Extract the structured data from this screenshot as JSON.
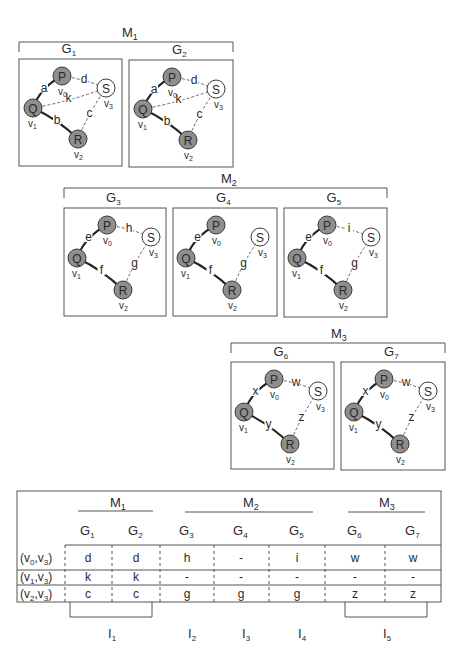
{
  "groups": [
    {
      "id": "M1",
      "label": "M",
      "sub": "1",
      "x1": 19,
      "x2": 233,
      "bracket_y": 42,
      "label_x": 126,
      "label_y": 36
    },
    {
      "id": "M2",
      "label": "M",
      "sub": "2",
      "x1": 64,
      "x2": 387,
      "bracket_y": 188,
      "label_x": 228,
      "label_y": 182
    },
    {
      "id": "M3",
      "label": "M",
      "sub": "3",
      "x1": 231,
      "x2": 445,
      "bracket_y": 343,
      "label_x": 338,
      "label_y": 337
    }
  ],
  "graphs": [
    {
      "id": "G1",
      "label": "G",
      "sub": "1",
      "x": 19,
      "y": 59,
      "w": 103,
      "h": 107,
      "edges": {
        "a": "a",
        "b": "b",
        "k": "k",
        "c": "c",
        "d": "d",
        "e": "",
        "f": "",
        "g": "",
        "h": ""
      },
      "variant": "full"
    },
    {
      "id": "G2",
      "label": "G",
      "sub": "2",
      "x": 129,
      "y": 60,
      "w": 104,
      "h": 107,
      "variant": "full"
    },
    {
      "id": "G3",
      "label": "G",
      "sub": "3",
      "x": 64,
      "y": 208,
      "w": 102,
      "h": 108,
      "variant": "m2"
    },
    {
      "id": "G4",
      "label": "G",
      "sub": "4",
      "x": 173,
      "y": 208,
      "w": 104,
      "h": 108,
      "variant": "m2"
    },
    {
      "id": "G5",
      "label": "G",
      "sub": "5",
      "x": 284,
      "y": 208,
      "w": 103,
      "h": 109,
      "variant": "m2"
    },
    {
      "id": "G6",
      "label": "G",
      "sub": "6",
      "x": 231,
      "y": 362,
      "w": 103,
      "h": 107,
      "variant": "m3"
    },
    {
      "id": "G7",
      "label": "G",
      "sub": "7",
      "x": 341,
      "y": 362,
      "w": 104,
      "h": 108,
      "variant": "m3"
    }
  ],
  "graph_edges": {
    "G1": {
      "PQ": "a",
      "QR": "b",
      "QS": "k",
      "RS": "c",
      "PS": "d"
    },
    "G2": {
      "PQ": "a",
      "QR": "b",
      "QS": "k",
      "RS": "c",
      "PS": "d"
    },
    "G3": {
      "PQ": "e",
      "QR": "f",
      "QS": "",
      "RS": "g",
      "PS": "h"
    },
    "G4": {
      "PQ": "e",
      "QR": "f",
      "QS": "",
      "RS": "g",
      "PS": ""
    },
    "G5": {
      "PQ": "e",
      "QR": "f",
      "QS": "",
      "RS": "g",
      "PS": "i"
    },
    "G6": {
      "PQ": "x",
      "QR": "y",
      "QS": "",
      "RS": "z",
      "PS": "w"
    },
    "G7": {
      "PQ": "x",
      "QR": "y",
      "QS": "",
      "RS": "z",
      "PS": "w"
    }
  },
  "nodes": [
    {
      "id": "P",
      "label": "P",
      "vertex": "v",
      "vsub": "0",
      "filled": true
    },
    {
      "id": "Q",
      "label": "Q",
      "vertex": "v",
      "vsub": "1",
      "filled": true
    },
    {
      "id": "R",
      "label": "R",
      "vertex": "v",
      "vsub": "2",
      "filled": true
    },
    {
      "id": "S",
      "label": "S",
      "vertex": "v",
      "vsub": "3",
      "filled": false
    }
  ],
  "colors": {
    "node_fill": "#8e8e8e",
    "node_stroke": "#3a3a3a",
    "open_fill": "#ffffff",
    "line": "#2a2a2a",
    "frame": "#555555"
  },
  "table": {
    "group_headers": [
      {
        "label": "M",
        "sub": "1"
      },
      {
        "label": "M",
        "sub": "2"
      },
      {
        "label": "M",
        "sub": "3"
      }
    ],
    "columns": [
      {
        "label": "G",
        "sub": "1"
      },
      {
        "label": "G",
        "sub": "2"
      },
      {
        "label": "G",
        "sub": "3"
      },
      {
        "label": "G",
        "sub": "4"
      },
      {
        "label": "G",
        "sub": "5"
      },
      {
        "label": "G",
        "sub": "6"
      },
      {
        "label": "G",
        "sub": "7"
      }
    ],
    "rows": [
      {
        "header": "(v0,v3)",
        "h1": "0",
        "h2": "3",
        "cells": [
          "d",
          "d",
          "h",
          "-",
          "i",
          "w",
          "w"
        ]
      },
      {
        "header": "(v1,v3)",
        "h1": "1",
        "h2": "3",
        "cells": [
          "k",
          "k",
          "-",
          "-",
          "-",
          "-",
          "-"
        ]
      },
      {
        "header": "(v2,v3)",
        "h1": "2",
        "h2": "3",
        "cells": [
          "c",
          "c",
          "g",
          "g",
          "g",
          "z",
          "z"
        ]
      }
    ],
    "intervals": [
      {
        "label": "I",
        "sub": "1"
      },
      {
        "label": "I",
        "sub": "2"
      },
      {
        "label": "I",
        "sub": "3"
      },
      {
        "label": "I",
        "sub": "4"
      },
      {
        "label": "I",
        "sub": "5"
      }
    ]
  }
}
